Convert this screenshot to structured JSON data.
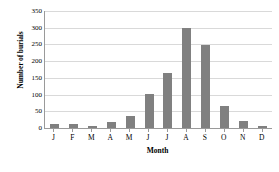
{
  "chart_data": {
    "type": "bar",
    "title": "",
    "xlabel": "Month",
    "ylabel": "Number of burials",
    "categories": [
      "J",
      "F",
      "M",
      "A",
      "M",
      "J",
      "J",
      "A",
      "S",
      "O",
      "N",
      "D"
    ],
    "values": [
      12,
      13,
      7,
      18,
      37,
      102,
      165,
      298,
      248,
      66,
      21,
      7
    ],
    "ylim": [
      0,
      350
    ],
    "yticks": [
      0,
      50,
      100,
      150,
      200,
      250,
      300,
      350
    ],
    "ytick_labels": [
      "0",
      "50",
      "100",
      "150",
      "200",
      "250",
      "300",
      "350"
    ],
    "grid": true,
    "legend": false,
    "bar_color": "#808080",
    "gridline_color": "#d9d9d9",
    "axis_color": "#9a9a9a"
  }
}
